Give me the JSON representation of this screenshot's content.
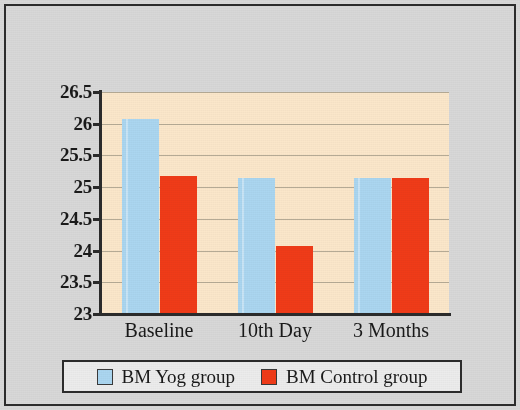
{
  "figure": {
    "background_color": "#d8d8d8",
    "frame_color": "#2c2c2c"
  },
  "chart_data": {
    "type": "bar",
    "title": "",
    "subtitle": "",
    "xlabel": "",
    "ylabel": "",
    "categories": [
      "Baseline",
      "10th Day",
      "3 Months"
    ],
    "series": [
      {
        "name": "BM Yog group",
        "color": "#ABD6F0",
        "values": [
          26.07,
          25.15,
          25.15
        ]
      },
      {
        "name": "BM Control group",
        "color": "#F03B18",
        "values": [
          25.17,
          24.07,
          25.15
        ]
      }
    ],
    "ylim": [
      23,
      26.5
    ],
    "y_ticks": [
      23,
      23.5,
      24,
      24.5,
      25,
      25.5,
      26,
      26.5
    ],
    "y_tick_labels": [
      "23",
      "23.5",
      "24",
      "24.5",
      "25",
      "25.5",
      "26",
      "26.5"
    ],
    "grid": true,
    "grid_axis": "y",
    "grid_color": "#a9a08c",
    "plot_background": "#fbe7ca",
    "legend_position": "bottom",
    "legend_entries": [
      "BM Yog group",
      "BM Control group"
    ]
  },
  "legend": {
    "entries": [
      {
        "label": "BM Yog group",
        "swatch": "legend-swatch-yog"
      },
      {
        "label": "BM Control group",
        "swatch": "legend-swatch-control"
      }
    ]
  }
}
